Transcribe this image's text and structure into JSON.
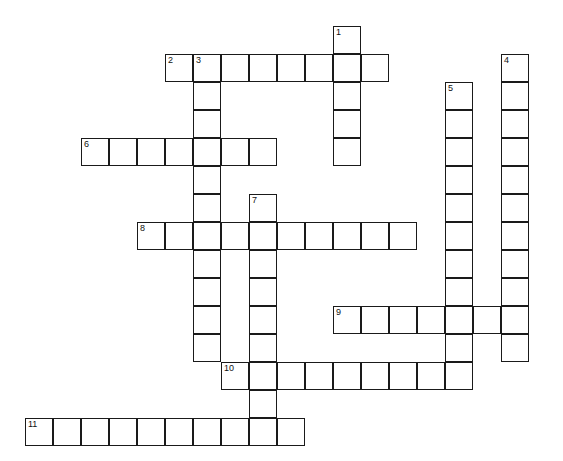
{
  "puzzle": {
    "type": "crossword-grid",
    "title": "Crossword puzzle grid",
    "cell_size": 28,
    "origin": {
      "x": 25,
      "y": 26
    },
    "grid_columns": 19,
    "grid_rows": 15,
    "colors": {
      "background": "#ffffff",
      "cell_fill": "#ffffff",
      "cell_border": "#1a1a1a",
      "number_text": "#111111"
    },
    "entries": [
      {
        "number": "1",
        "direction": "down",
        "row": 0,
        "col": 11,
        "length": 5
      },
      {
        "number": "2",
        "direction": "across",
        "row": 1,
        "col": 5,
        "length": 8
      },
      {
        "number": "3",
        "direction": "down",
        "row": 1,
        "col": 6,
        "length": 12
      },
      {
        "number": "4",
        "direction": "down",
        "row": 1,
        "col": 17,
        "length": 11
      },
      {
        "number": "5",
        "direction": "down",
        "row": 2,
        "col": 15,
        "length": 10
      },
      {
        "number": "6",
        "direction": "across",
        "row": 4,
        "col": 2,
        "length": 7
      },
      {
        "number": "7",
        "direction": "down",
        "row": 6,
        "col": 8,
        "length": 9
      },
      {
        "number": "8",
        "direction": "across",
        "row": 7,
        "col": 4,
        "length": 10
      },
      {
        "number": "9",
        "direction": "across",
        "row": 10,
        "col": 11,
        "length": 7
      },
      {
        "number": "10",
        "direction": "across",
        "row": 12,
        "col": 7,
        "length": 9
      },
      {
        "number": "11",
        "direction": "across",
        "row": 14,
        "col": 0,
        "length": 10
      }
    ],
    "cells": [
      {
        "row": 0,
        "col": 11,
        "number": "1"
      },
      {
        "row": 1,
        "col": 5,
        "number": "2"
      },
      {
        "row": 1,
        "col": 6,
        "number": "3"
      },
      {
        "row": 1,
        "col": 7,
        "number": ""
      },
      {
        "row": 1,
        "col": 8,
        "number": ""
      },
      {
        "row": 1,
        "col": 9,
        "number": ""
      },
      {
        "row": 1,
        "col": 10,
        "number": ""
      },
      {
        "row": 1,
        "col": 11,
        "number": ""
      },
      {
        "row": 1,
        "col": 12,
        "number": ""
      },
      {
        "row": 1,
        "col": 17,
        "number": "4"
      },
      {
        "row": 2,
        "col": 6,
        "number": ""
      },
      {
        "row": 2,
        "col": 11,
        "number": ""
      },
      {
        "row": 2,
        "col": 15,
        "number": "5"
      },
      {
        "row": 2,
        "col": 17,
        "number": ""
      },
      {
        "row": 3,
        "col": 6,
        "number": ""
      },
      {
        "row": 3,
        "col": 11,
        "number": ""
      },
      {
        "row": 3,
        "col": 15,
        "number": ""
      },
      {
        "row": 3,
        "col": 17,
        "number": ""
      },
      {
        "row": 4,
        "col": 2,
        "number": "6"
      },
      {
        "row": 4,
        "col": 3,
        "number": ""
      },
      {
        "row": 4,
        "col": 4,
        "number": ""
      },
      {
        "row": 4,
        "col": 5,
        "number": ""
      },
      {
        "row": 4,
        "col": 6,
        "number": ""
      },
      {
        "row": 4,
        "col": 7,
        "number": ""
      },
      {
        "row": 4,
        "col": 8,
        "number": ""
      },
      {
        "row": 4,
        "col": 11,
        "number": ""
      },
      {
        "row": 4,
        "col": 15,
        "number": ""
      },
      {
        "row": 4,
        "col": 17,
        "number": ""
      },
      {
        "row": 5,
        "col": 6,
        "number": ""
      },
      {
        "row": 5,
        "col": 15,
        "number": ""
      },
      {
        "row": 5,
        "col": 17,
        "number": ""
      },
      {
        "row": 6,
        "col": 6,
        "number": ""
      },
      {
        "row": 6,
        "col": 8,
        "number": "7"
      },
      {
        "row": 6,
        "col": 15,
        "number": ""
      },
      {
        "row": 6,
        "col": 17,
        "number": ""
      },
      {
        "row": 7,
        "col": 4,
        "number": "8"
      },
      {
        "row": 7,
        "col": 5,
        "number": ""
      },
      {
        "row": 7,
        "col": 6,
        "number": ""
      },
      {
        "row": 7,
        "col": 7,
        "number": ""
      },
      {
        "row": 7,
        "col": 8,
        "number": ""
      },
      {
        "row": 7,
        "col": 9,
        "number": ""
      },
      {
        "row": 7,
        "col": 10,
        "number": ""
      },
      {
        "row": 7,
        "col": 11,
        "number": ""
      },
      {
        "row": 7,
        "col": 12,
        "number": ""
      },
      {
        "row": 7,
        "col": 13,
        "number": ""
      },
      {
        "row": 7,
        "col": 15,
        "number": ""
      },
      {
        "row": 7,
        "col": 17,
        "number": ""
      },
      {
        "row": 8,
        "col": 6,
        "number": ""
      },
      {
        "row": 8,
        "col": 8,
        "number": ""
      },
      {
        "row": 8,
        "col": 15,
        "number": ""
      },
      {
        "row": 8,
        "col": 17,
        "number": ""
      },
      {
        "row": 9,
        "col": 6,
        "number": ""
      },
      {
        "row": 9,
        "col": 8,
        "number": ""
      },
      {
        "row": 9,
        "col": 15,
        "number": ""
      },
      {
        "row": 9,
        "col": 17,
        "number": ""
      },
      {
        "row": 10,
        "col": 6,
        "number": ""
      },
      {
        "row": 10,
        "col": 8,
        "number": ""
      },
      {
        "row": 10,
        "col": 11,
        "number": "9"
      },
      {
        "row": 10,
        "col": 12,
        "number": ""
      },
      {
        "row": 10,
        "col": 13,
        "number": ""
      },
      {
        "row": 10,
        "col": 14,
        "number": ""
      },
      {
        "row": 10,
        "col": 15,
        "number": ""
      },
      {
        "row": 10,
        "col": 16,
        "number": ""
      },
      {
        "row": 10,
        "col": 17,
        "number": ""
      },
      {
        "row": 11,
        "col": 6,
        "number": ""
      },
      {
        "row": 11,
        "col": 8,
        "number": ""
      },
      {
        "row": 11,
        "col": 15,
        "number": ""
      },
      {
        "row": 11,
        "col": 17,
        "number": ""
      },
      {
        "row": 12,
        "col": 7,
        "number": "10"
      },
      {
        "row": 12,
        "col": 8,
        "number": ""
      },
      {
        "row": 12,
        "col": 9,
        "number": ""
      },
      {
        "row": 12,
        "col": 10,
        "number": ""
      },
      {
        "row": 12,
        "col": 11,
        "number": ""
      },
      {
        "row": 12,
        "col": 12,
        "number": ""
      },
      {
        "row": 12,
        "col": 13,
        "number": ""
      },
      {
        "row": 12,
        "col": 14,
        "number": ""
      },
      {
        "row": 12,
        "col": 15,
        "number": ""
      },
      {
        "row": 13,
        "col": 8,
        "number": ""
      },
      {
        "row": 14,
        "col": 0,
        "number": "11"
      },
      {
        "row": 14,
        "col": 1,
        "number": ""
      },
      {
        "row": 14,
        "col": 2,
        "number": ""
      },
      {
        "row": 14,
        "col": 3,
        "number": ""
      },
      {
        "row": 14,
        "col": 4,
        "number": ""
      },
      {
        "row": 14,
        "col": 5,
        "number": ""
      },
      {
        "row": 14,
        "col": 6,
        "number": ""
      },
      {
        "row": 14,
        "col": 7,
        "number": ""
      },
      {
        "row": 14,
        "col": 8,
        "number": ""
      },
      {
        "row": 14,
        "col": 9,
        "number": ""
      }
    ]
  }
}
